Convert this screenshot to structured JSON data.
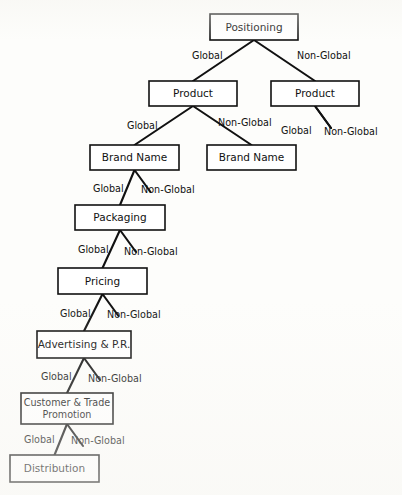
{
  "diagram": {
    "colors": {
      "stroke": "#111111",
      "box_fill": "#ffffff",
      "page": "#fdfdfb"
    },
    "branch_labels": {
      "global": "Global",
      "non_global": "Non-Global"
    },
    "nodes": [
      {
        "id": "positioning",
        "label": "Positioning",
        "x": 210,
        "y": 14,
        "w": 88,
        "h": 26
      },
      {
        "id": "product-left",
        "label": "Product",
        "x": 149,
        "y": 81,
        "w": 88,
        "h": 25
      },
      {
        "id": "product-right",
        "label": "Product",
        "x": 271,
        "y": 81,
        "w": 88,
        "h": 25
      },
      {
        "id": "brand-left",
        "label": "Brand Name",
        "x": 90,
        "y": 145,
        "w": 89,
        "h": 25
      },
      {
        "id": "brand-right",
        "label": "Brand Name",
        "x": 207,
        "y": 145,
        "w": 89,
        "h": 25
      },
      {
        "id": "packaging",
        "label": "Packaging",
        "x": 75,
        "y": 205,
        "w": 90,
        "h": 25
      },
      {
        "id": "pricing",
        "label": "Pricing",
        "x": 58,
        "y": 268,
        "w": 89,
        "h": 26
      },
      {
        "id": "advertising",
        "label": "Advertising & P.R.",
        "x": 37,
        "y": 331,
        "w": 94,
        "h": 27
      },
      {
        "id": "customer",
        "label_line1": "Customer & Trade",
        "label_line2": "Promotion",
        "x": 21,
        "y": 393,
        "w": 92,
        "h": 31
      },
      {
        "id": "distribution",
        "label": "Distribution",
        "x": 10,
        "y": 455,
        "w": 89,
        "h": 27
      }
    ],
    "edges": [
      {
        "id": "positioning-global",
        "from": "positioning",
        "to": "product-left",
        "branch": "global",
        "label_x": 192,
        "label_y": 56,
        "anchor": "start"
      },
      {
        "id": "positioning-nonglobal",
        "from": "positioning",
        "to": "product-right",
        "branch": "non_global",
        "label_x": 297,
        "label_y": 56,
        "anchor": "start"
      },
      {
        "id": "product-left-global",
        "from": "product-left",
        "to": "brand-left",
        "branch": "global",
        "label_x": 127,
        "label_y": 126,
        "anchor": "start"
      },
      {
        "id": "product-left-nonglobal",
        "from": "product-left",
        "to": "brand-right",
        "branch": "non_global",
        "label_x": 218,
        "label_y": 123,
        "anchor": "start"
      },
      {
        "id": "product-right-global",
        "from": "product-right",
        "to": null,
        "branch": "global",
        "label_x": 281,
        "label_y": 131,
        "anchor": "start"
      },
      {
        "id": "product-right-nonglobal",
        "from": "product-right",
        "to": null,
        "branch": "non_global",
        "label_x": 324,
        "label_y": 132,
        "anchor": "start"
      },
      {
        "id": "brand-left-global",
        "from": "brand-left",
        "to": "packaging",
        "branch": "global",
        "label_x": 93,
        "label_y": 189,
        "anchor": "start"
      },
      {
        "id": "brand-left-nonglobal",
        "from": "brand-left",
        "to": null,
        "branch": "non_global",
        "label_x": 141,
        "label_y": 190,
        "anchor": "start"
      },
      {
        "id": "packaging-global",
        "from": "packaging",
        "to": "pricing",
        "branch": "global",
        "label_x": 78,
        "label_y": 250,
        "anchor": "start"
      },
      {
        "id": "packaging-nonglobal",
        "from": "packaging",
        "to": null,
        "branch": "non_global",
        "label_x": 124,
        "label_y": 252,
        "anchor": "start"
      },
      {
        "id": "pricing-global",
        "from": "pricing",
        "to": "advertising",
        "branch": "global",
        "label_x": 60,
        "label_y": 314,
        "anchor": "start"
      },
      {
        "id": "pricing-nonglobal",
        "from": "pricing",
        "to": null,
        "branch": "non_global",
        "label_x": 107,
        "label_y": 315,
        "anchor": "start"
      },
      {
        "id": "advertising-global",
        "from": "advertising",
        "to": "customer",
        "branch": "global",
        "label_x": 41,
        "label_y": 377,
        "anchor": "start"
      },
      {
        "id": "advertising-nonglobal",
        "from": "advertising",
        "to": null,
        "branch": "non_global",
        "label_x": 88,
        "label_y": 379,
        "anchor": "start"
      },
      {
        "id": "customer-global",
        "from": "customer",
        "to": "distribution",
        "branch": "global",
        "label_x": 24,
        "label_y": 440,
        "anchor": "start"
      },
      {
        "id": "customer-nonglobal",
        "from": "customer",
        "to": null,
        "branch": "non_global",
        "label_x": 71,
        "label_y": 441,
        "anchor": "start"
      }
    ]
  }
}
